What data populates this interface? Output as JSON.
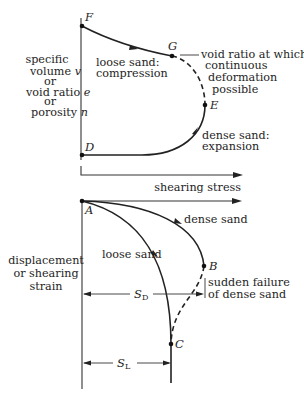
{
  "upper_chart": {
    "y_axis_label_lines": [
      "specific",
      "volume v",
      "or",
      "void ratio e",
      "or",
      "porosity n"
    ],
    "x_axis_label": "shearing stress",
    "points": {
      "F": "F",
      "G": "G",
      "E": "E",
      "D": "D"
    },
    "annotations": {
      "loose_1": "loose sand:",
      "loose_2": "compression",
      "void_1": "void ratio at which",
      "void_2": "continuous",
      "void_3": "deformation",
      "void_4": "possible",
      "dense_1": "dense sand:",
      "dense_2": "expansion"
    }
  },
  "lower_chart": {
    "y_axis_label_lines": [
      "displacement",
      "or shearing",
      "strain"
    ],
    "points": {
      "A": "A",
      "B": "B",
      "C": "C"
    },
    "annotations": {
      "dense": "dense sand",
      "loose": "loose sand",
      "failure_1": "sudden failure",
      "failure_2": "of dense sand"
    },
    "dimensions": {
      "SD_main": "S",
      "SD_sub": "D",
      "SL_main": "S",
      "SL_sub": "L"
    }
  },
  "colors": {
    "ink": "#1e1e1e",
    "background": "#ffffff"
  }
}
